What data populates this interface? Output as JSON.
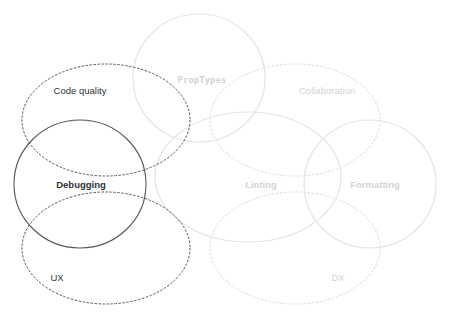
{
  "diagram": {
    "type": "venn",
    "colors": {
      "active_stroke": "#555555",
      "inactive_stroke": "#e4e4e4",
      "active_text": "#333333",
      "inactive_text": "#d4d4d4"
    },
    "sets": [
      {
        "id": "code-quality",
        "label": "Code quality",
        "cx": 106,
        "cy": 120,
        "rx": 84,
        "ry": 56,
        "stroke": "dashed",
        "state": "active",
        "label_x": 80,
        "label_y": 91
      },
      {
        "id": "debugging",
        "label": "Debugging",
        "cx": 80,
        "cy": 184,
        "rx": 66,
        "ry": 64,
        "stroke": "solid",
        "state": "active",
        "label_x": 81,
        "label_y": 185
      },
      {
        "id": "ux",
        "label": "UX",
        "cx": 106,
        "cy": 248,
        "rx": 84,
        "ry": 56,
        "stroke": "dashed",
        "state": "active",
        "label_x": 57,
        "label_y": 278
      },
      {
        "id": "proptypes",
        "label": "PropTypes",
        "cx": 199,
        "cy": 78,
        "rx": 66,
        "ry": 64,
        "stroke": "solid",
        "state": "inactive",
        "label_x": 202,
        "label_y": 80
      },
      {
        "id": "collaboration",
        "label": "Collaboration",
        "cx": 295,
        "cy": 120,
        "rx": 85,
        "ry": 56,
        "stroke": "dashed",
        "state": "inactive",
        "label_x": 327,
        "label_y": 91
      },
      {
        "id": "linting",
        "label": "Linting",
        "cx": 248,
        "cy": 177,
        "rx": 93,
        "ry": 65,
        "stroke": "solid",
        "state": "inactive",
        "label_x": 261,
        "label_y": 185
      },
      {
        "id": "formatting",
        "label": "Formatting",
        "cx": 370,
        "cy": 184,
        "rx": 66,
        "ry": 64,
        "stroke": "solid",
        "state": "inactive",
        "label_x": 375,
        "label_y": 185
      },
      {
        "id": "dx",
        "label": "DX",
        "cx": 295,
        "cy": 248,
        "rx": 85,
        "ry": 56,
        "stroke": "dashed",
        "state": "inactive",
        "label_x": 338,
        "label_y": 278
      }
    ]
  }
}
